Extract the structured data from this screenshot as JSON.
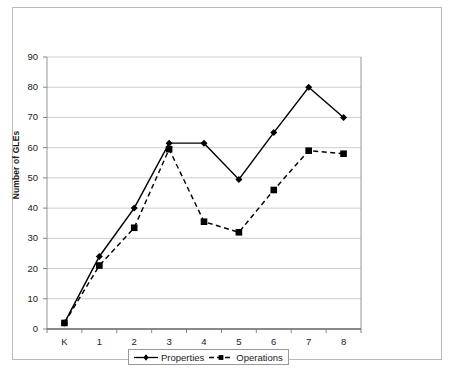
{
  "chart_data": {
    "type": "line",
    "title": "",
    "xlabel": "",
    "ylabel": "Number of GLEs",
    "categories": [
      "K",
      "1",
      "2",
      "3",
      "4",
      "5",
      "6",
      "7",
      "8"
    ],
    "ylim": [
      0,
      90
    ],
    "ytick_step": 10,
    "yticks": [
      "0",
      "10",
      "20",
      "30",
      "40",
      "50",
      "60",
      "70",
      "80",
      "90"
    ],
    "grid": "horizontal",
    "legend_position": "bottom",
    "series": [
      {
        "name": "Properties",
        "marker": "diamond",
        "line_style": "solid",
        "color": "#000000",
        "values": [
          2,
          24,
          40,
          61.5,
          61.5,
          49.5,
          65,
          80,
          70
        ]
      },
      {
        "name": "Operations",
        "marker": "square",
        "line_style": "dashed",
        "color": "#000000",
        "values": [
          2,
          21,
          33.5,
          59.5,
          35.5,
          32,
          46,
          59,
          58
        ]
      }
    ]
  },
  "axis": {
    "y_title": "Number of GLEs"
  },
  "legend": {
    "items": [
      {
        "label": "Properties"
      },
      {
        "label": "Operations"
      }
    ]
  }
}
